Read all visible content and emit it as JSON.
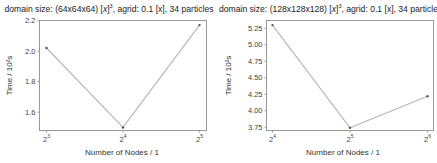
{
  "chart_data": [
    {
      "type": "line",
      "title": "domain size: (64x64x64) [x]^3, agrid: 0.1 [x], 34 particles",
      "title_parts": {
        "prefix": "domain size: (64x64x64) [",
        "unit": "x",
        "exp": "3",
        "suffix": ", agrid: 0.1 [x], 34 particles"
      },
      "xlabel": "Number of Nodes / 1",
      "ylabel": "Time / 10²s",
      "x_scale": "log2",
      "x": [
        8,
        16,
        32
      ],
      "xtick_labels": [
        {
          "base": "2",
          "exp": "3"
        },
        {
          "base": "2",
          "exp": "4"
        },
        {
          "base": "2",
          "exp": "5"
        }
      ],
      "values": [
        2.02,
        1.5,
        2.17
      ],
      "yticks": [
        "1.6",
        "1.8",
        "2.0",
        "2.2"
      ],
      "ylim": [
        1.48,
        2.2
      ],
      "grid": false,
      "line_color": "#b8b8b8",
      "marker_color": "#555555"
    },
    {
      "type": "line",
      "title": "domain size: (128x128x128) [x]^3, agrid: 0.1 [x], 34 particles",
      "title_parts": {
        "prefix": "domain size: (128x128x128) [",
        "unit": "x",
        "exp": "3",
        "suffix": ", agrid: 0.1 [x], 34 particles"
      },
      "xlabel": "Number of Nodes / 1",
      "ylabel": "Time / 10²s",
      "x_scale": "log2",
      "x": [
        16,
        32,
        64
      ],
      "xtick_labels": [
        {
          "base": "2",
          "exp": "4"
        },
        {
          "base": "2",
          "exp": "5"
        },
        {
          "base": "2",
          "exp": "6"
        }
      ],
      "values": [
        5.3,
        3.74,
        4.22
      ],
      "yticks": [
        "3.75",
        "4.00",
        "4.25",
        "4.50",
        "4.75",
        "5.00",
        "5.25"
      ],
      "ylim": [
        3.7,
        5.37
      ],
      "grid": false,
      "line_color": "#b8b8b8",
      "marker_color": "#555555"
    }
  ]
}
